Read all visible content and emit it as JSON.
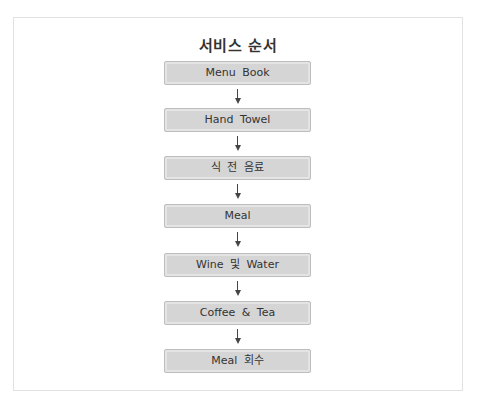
{
  "diagram": {
    "title": "서비스 순서",
    "steps": [
      {
        "label": "Menu Book"
      },
      {
        "label": "Hand Towel"
      },
      {
        "label": "식 전 음료"
      },
      {
        "label": "Meal"
      },
      {
        "label": "Wine 및 Water"
      },
      {
        "label": "Coffee & Tea"
      },
      {
        "label": "Meal 회수"
      }
    ],
    "connector": "down-arrow",
    "colors": {
      "box_fill": "#d5d5d5",
      "box_border": "#bdbdbd",
      "arrow": "#444444",
      "text": "#333333"
    }
  }
}
